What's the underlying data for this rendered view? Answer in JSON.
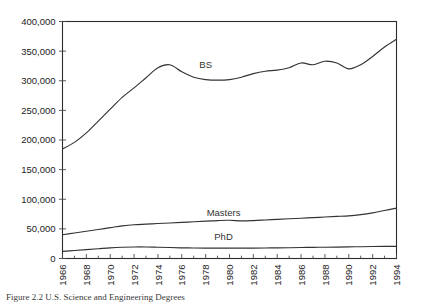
{
  "figure": {
    "caption": "Figure 2.2 U.S. Science and Engineering Degrees"
  },
  "chart_data": {
    "type": "line",
    "title": "",
    "xlabel": "",
    "ylabel": "",
    "xlim": [
      1966,
      1994
    ],
    "ylim": [
      0,
      400000
    ],
    "grid": false,
    "legend_position": "inline-labels",
    "y_ticks": [
      0,
      50000,
      100000,
      150000,
      200000,
      250000,
      300000,
      350000,
      400000
    ],
    "y_tick_labels": [
      "0",
      "50,000",
      "100,000",
      "150,000",
      "200,000",
      "250,000",
      "300,000",
      "350,000",
      "400,000"
    ],
    "x_tick_labels": [
      "1966",
      "1968",
      "1970",
      "1972",
      "1974",
      "1976",
      "1978",
      "1980",
      "1982",
      "1984",
      "1986",
      "1988",
      "1990",
      "1992",
      "1994"
    ],
    "x_minor_tick_step": 1,
    "x": [
      1966,
      1967,
      1968,
      1969,
      1970,
      1971,
      1972,
      1973,
      1974,
      1975,
      1976,
      1977,
      1978,
      1979,
      1980,
      1981,
      1982,
      1983,
      1984,
      1985,
      1986,
      1987,
      1988,
      1989,
      1990,
      1991,
      1992,
      1993,
      1994
    ],
    "series": [
      {
        "name": "BS",
        "label": "BS",
        "label_x": 1978.0,
        "label_y": 322000,
        "values": [
          185000,
          196000,
          212000,
          232000,
          252000,
          272000,
          288000,
          305000,
          322000,
          327000,
          315000,
          306000,
          302000,
          301000,
          302000,
          306000,
          312000,
          316000,
          318000,
          322000,
          330000,
          327000,
          333000,
          330000,
          320000,
          327000,
          341000,
          357000,
          370000
        ]
      },
      {
        "name": "Masters",
        "label": "Masters",
        "label_x": 1979.5,
        "label_y": 72000,
        "values": [
          40000,
          43000,
          46000,
          49000,
          52000,
          55000,
          57000,
          58000,
          59000,
          60000,
          61000,
          62000,
          63000,
          64000,
          64500,
          63500,
          64000,
          65000,
          66000,
          67000,
          68000,
          69000,
          70000,
          71000,
          72000,
          74000,
          77000,
          81000,
          85000
        ]
      },
      {
        "name": "PhD",
        "label": "PhD",
        "label_x": 1979.5,
        "label_y": 31000,
        "values": [
          12000,
          13500,
          15000,
          16500,
          18000,
          19000,
          19500,
          19500,
          19000,
          18500,
          18000,
          17800,
          17600,
          17500,
          17400,
          17500,
          17600,
          17800,
          18000,
          18200,
          18500,
          18800,
          19000,
          19300,
          19600,
          19900,
          20200,
          20400,
          20500
        ]
      }
    ]
  }
}
